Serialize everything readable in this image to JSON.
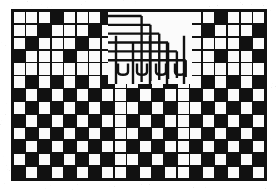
{
  "image": {
    "title": "Black and white mosaic grid test pattern with serpentine meander",
    "width": 277,
    "height": 190,
    "background_color": "#ffffff",
    "ink_color": "#111111",
    "paper_color": "#fdfdfd"
  },
  "frame": {
    "x": 11,
    "y": 9,
    "width": 256,
    "height": 172,
    "border_color": "#111111",
    "border_width": 2
  },
  "grid": {
    "columns": 20,
    "rows": 13,
    "cell_width": 12.8,
    "cell_height": 13.23,
    "gap": 1.6,
    "line_color": "#111111",
    "fill_on": "#111111",
    "fill_off": "#fbfbfb",
    "description": "20 x 13 cell mosaic; 1 = black (ink) cell, 0 = white (paper) cell"
  },
  "mosaic": {
    "legend": {
      "0": "white-cell",
      "1": "black-cell"
    },
    "rows": [
      [
        0,
        0,
        0,
        1,
        0,
        0,
        0,
        1,
        0,
        0,
        0,
        0,
        0,
        0,
        0,
        0,
        1,
        0,
        0,
        0
      ],
      [
        0,
        0,
        1,
        0,
        0,
        0,
        1,
        0,
        0,
        0,
        0,
        0,
        0,
        0,
        0,
        1,
        0,
        0,
        0,
        1
      ],
      [
        0,
        1,
        0,
        0,
        0,
        1,
        0,
        0,
        0,
        0,
        0,
        0,
        0,
        0,
        0,
        0,
        0,
        0,
        1,
        0
      ],
      [
        1,
        0,
        0,
        0,
        1,
        0,
        0,
        0,
        0,
        0,
        0,
        0,
        0,
        0,
        0,
        0,
        1,
        0,
        0,
        1
      ],
      [
        0,
        0,
        0,
        0,
        0,
        0,
        0,
        0,
        0,
        0,
        0,
        0,
        0,
        0,
        0,
        0,
        0,
        0,
        0,
        0
      ],
      [
        0,
        1,
        0,
        1,
        0,
        1,
        0,
        1,
        0,
        0,
        1,
        0,
        1,
        0,
        0,
        1,
        0,
        1,
        0,
        1
      ],
      [
        1,
        0,
        1,
        0,
        1,
        0,
        1,
        0,
        0,
        1,
        0,
        1,
        0,
        0,
        1,
        0,
        1,
        0,
        1,
        0
      ],
      [
        0,
        1,
        0,
        1,
        0,
        1,
        0,
        1,
        0,
        0,
        1,
        0,
        1,
        0,
        0,
        1,
        0,
        1,
        0,
        1
      ],
      [
        1,
        0,
        1,
        0,
        1,
        0,
        1,
        0,
        0,
        1,
        0,
        1,
        0,
        0,
        1,
        0,
        1,
        0,
        1,
        0
      ],
      [
        0,
        1,
        0,
        1,
        0,
        1,
        0,
        1,
        0,
        0,
        1,
        0,
        1,
        0,
        0,
        1,
        0,
        1,
        0,
        1
      ],
      [
        1,
        0,
        1,
        0,
        1,
        0,
        1,
        0,
        0,
        1,
        0,
        1,
        0,
        0,
        1,
        0,
        1,
        0,
        1,
        0
      ],
      [
        0,
        1,
        0,
        1,
        0,
        1,
        0,
        1,
        0,
        0,
        1,
        0,
        1,
        0,
        0,
        1,
        0,
        1,
        0,
        1
      ],
      [
        1,
        0,
        1,
        0,
        1,
        0,
        1,
        0,
        0,
        1,
        0,
        1,
        0,
        0,
        1,
        0,
        1,
        0,
        1,
        0
      ]
    ]
  },
  "meander": {
    "label": "serpentine-meander-trace",
    "region": {
      "x": 108,
      "y": 12,
      "width": 84,
      "height": 72
    },
    "stroke_color": "#111111",
    "stroke_width": 2.4,
    "horizontal_arms": 6,
    "vertical_arms": 5,
    "description": "Interleaved comb of horizontal arms entering from the left joined to vertical arms descending to the bottom of the region"
  },
  "texture": {
    "speckle_color": "#9a9a9a",
    "speckle_opacity": 0.2,
    "note": "light scanner speckle around the outer margins"
  }
}
